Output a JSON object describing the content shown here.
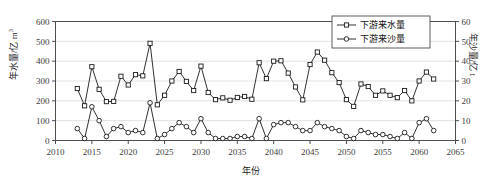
{
  "chart_data": {
    "type": "line",
    "title": "",
    "xlabel": "年份",
    "ylabel": "年水量/亿 m³",
    "ylabel_right": "年沙量/亿 t",
    "xlim": [
      2010,
      2065
    ],
    "ylim": [
      0,
      600
    ],
    "ylim_right": [
      0,
      60
    ],
    "xticks": [
      2010,
      2015,
      2020,
      2025,
      2030,
      2035,
      2040,
      2045,
      2050,
      2055,
      2060,
      2065
    ],
    "yticks": [
      0,
      100,
      200,
      300,
      400,
      500,
      600
    ],
    "yticks_right": [
      0,
      10,
      20,
      30,
      40,
      50,
      60
    ],
    "grid": "horizontal",
    "legend_position": "top-right",
    "x": [
      2013,
      2014,
      2015,
      2016,
      2017,
      2018,
      2019,
      2020,
      2021,
      2022,
      2023,
      2024,
      2025,
      2026,
      2027,
      2028,
      2029,
      2030,
      2031,
      2032,
      2033,
      2034,
      2035,
      2036,
      2037,
      2038,
      2039,
      2040,
      2041,
      2042,
      2043,
      2044,
      2045,
      2046,
      2047,
      2048,
      2049,
      2050,
      2051,
      2052,
      2053,
      2054,
      2055,
      2056,
      2057,
      2058,
      2059,
      2060,
      2061,
      2062
    ],
    "series": [
      {
        "name": "下游来水量",
        "axis": "left",
        "marker": "square",
        "color": "#1a1a1a",
        "values": [
          262,
          175,
          372,
          258,
          196,
          197,
          324,
          280,
          332,
          326,
          490,
          180,
          228,
          300,
          348,
          298,
          252,
          375,
          242,
          206,
          215,
          203,
          217,
          222,
          208,
          392,
          312,
          400,
          402,
          340,
          270,
          205,
          383,
          446,
          405,
          342,
          292,
          206,
          172,
          285,
          272,
          228,
          250,
          228,
          216,
          252,
          200,
          300,
          345,
          310
        ]
      },
      {
        "name": "下游来沙量",
        "axis": "right",
        "marker": "circle",
        "color": "#1a1a1a",
        "values": [
          6,
          1,
          17,
          10,
          2,
          6,
          7,
          4,
          5,
          4,
          19,
          1,
          3,
          6,
          9,
          7,
          4,
          11,
          4,
          1,
          1,
          1,
          2,
          2,
          1,
          11,
          1,
          8,
          9,
          9,
          7,
          5,
          5,
          9,
          7,
          6,
          5,
          2,
          1,
          5,
          4,
          3,
          3,
          2,
          1,
          4,
          1,
          9,
          11,
          5
        ]
      }
    ]
  },
  "legend": {
    "entries": [
      {
        "label": "下游来水量",
        "marker": "square"
      },
      {
        "label": "下游来沙量",
        "marker": "circle"
      }
    ]
  },
  "axes": {
    "y_left_title_main": "年水量/亿 m",
    "y_left_title_sup": "3",
    "y_right_title": "年沙量/亿 t",
    "x_title": "年份"
  }
}
